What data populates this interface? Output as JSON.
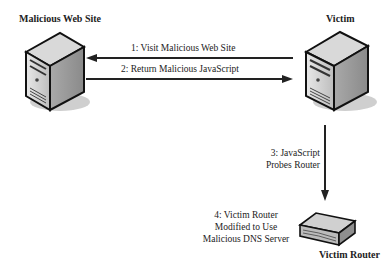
{
  "nodes": {
    "malicious_site": {
      "label": "Malicious Web Site",
      "icon": "server-tower-icon"
    },
    "victim": {
      "label": "Victim",
      "icon": "server-tower-icon"
    },
    "victim_router": {
      "label": "Victim Router",
      "icon": "router-icon"
    }
  },
  "edges": [
    {
      "label": "1: Visit Malicious Web Site",
      "from": "Victim",
      "to": "Malicious Web Site"
    },
    {
      "label": "2: Return Malicious JavaScript",
      "from": "Malicious Web Site",
      "to": "Victim"
    },
    {
      "label_line1": "3: JavaScript",
      "label_line2": "Probes Router",
      "from": "Victim",
      "to": "Victim Router"
    }
  ],
  "annotations": {
    "step4_line1": "4: Victim Router",
    "step4_line2": "Modified to Use",
    "step4_line3": "Malicious DNS Server"
  }
}
